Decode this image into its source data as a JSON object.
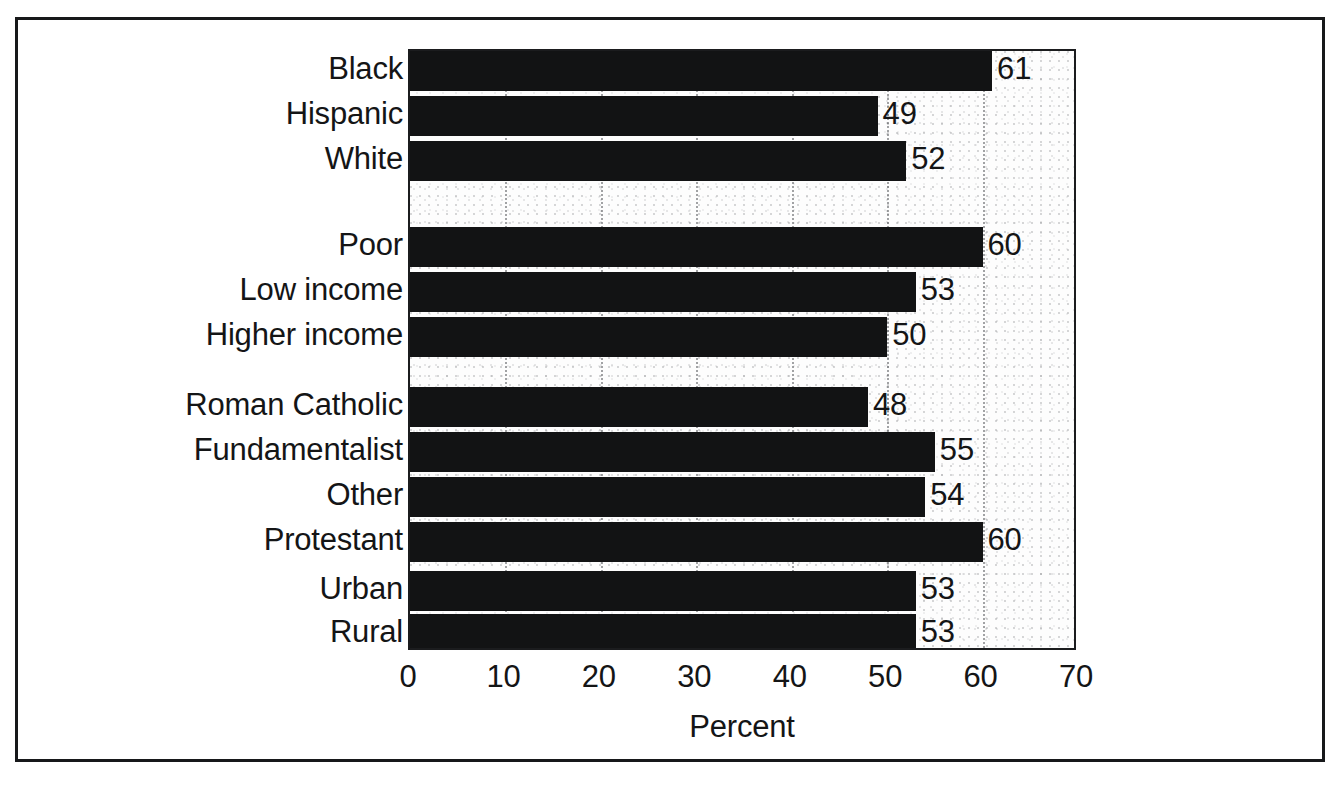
{
  "chart_data": {
    "type": "bar",
    "orientation": "horizontal",
    "title": "",
    "xlabel": "Percent",
    "ylabel": "",
    "xlim": [
      0,
      70
    ],
    "xticks": [
      0,
      10,
      20,
      30,
      40,
      50,
      60,
      70
    ],
    "xticklabels": [
      "0",
      "10",
      "20",
      "30",
      "40",
      "50",
      "60",
      "70"
    ],
    "grid": "vertical-dotted",
    "legend": "none",
    "bar_color": "#121314",
    "plot_background": "#fdfdfd",
    "groups": [
      {
        "name": "Race/ethnicity",
        "categories": [
          "Black",
          "Hispanic",
          "White"
        ],
        "values": [
          61,
          49,
          52
        ]
      },
      {
        "name": "Income",
        "categories": [
          "Poor",
          "Low income",
          "Higher income"
        ],
        "values": [
          60,
          53,
          50
        ]
      },
      {
        "name": "Religion",
        "categories": [
          "Roman Catholic",
          "Fundamentalist",
          "Other",
          "Protestant"
        ],
        "values": [
          48,
          55,
          54,
          60
        ]
      },
      {
        "name": "Residence",
        "categories": [
          "Urban",
          "Rural"
        ],
        "values": [
          53,
          53
        ]
      }
    ],
    "categories": [
      "Black",
      "Hispanic",
      "White",
      "Poor",
      "Low income",
      "Higher income",
      "Roman Catholic",
      "Fundamentalist",
      "Other",
      "Protestant",
      "Urban",
      "Rural"
    ],
    "values": [
      61,
      49,
      52,
      60,
      53,
      50,
      48,
      55,
      54,
      60,
      53,
      53
    ],
    "value_labels": [
      "61",
      "49",
      "52",
      "60",
      "53",
      "50",
      "48",
      "55",
      "54",
      "60",
      "53",
      "53"
    ]
  },
  "bars": [
    {
      "label": "Black",
      "value": 61,
      "value_label": "61",
      "top": 0
    },
    {
      "label": "Hispanic",
      "value": 49,
      "value_label": "49",
      "top": 45
    },
    {
      "label": "White",
      "value": 52,
      "value_label": "52",
      "top": 90
    },
    {
      "label": "Poor",
      "value": 60,
      "value_label": "60",
      "top": 176
    },
    {
      "label": "Low income",
      "value": 53,
      "value_label": "53",
      "top": 221
    },
    {
      "label": "Higher income",
      "value": 50,
      "value_label": "50",
      "top": 266
    },
    {
      "label": "Roman Catholic",
      "value": 48,
      "value_label": "48",
      "top": 336
    },
    {
      "label": "Fundamentalist",
      "value": 55,
      "value_label": "55",
      "top": 381
    },
    {
      "label": "Other",
      "value": 54,
      "value_label": "54",
      "top": 426
    },
    {
      "label": "Protestant",
      "value": 60,
      "value_label": "60",
      "top": 471
    },
    {
      "label": "Urban",
      "value": 53,
      "value_label": "53",
      "top": 520
    },
    {
      "label": "Rural",
      "value": 53,
      "value_label": "53",
      "top": 563
    }
  ],
  "axis": {
    "xlabel": "Percent",
    "ticks": [
      {
        "label": "0",
        "value": 0
      },
      {
        "label": "10",
        "value": 10
      },
      {
        "label": "20",
        "value": 20
      },
      {
        "label": "30",
        "value": 30
      },
      {
        "label": "40",
        "value": 40
      },
      {
        "label": "50",
        "value": 50
      },
      {
        "label": "60",
        "value": 60
      },
      {
        "label": "70",
        "value": 70
      }
    ]
  },
  "colors": {
    "bar": "#121314",
    "frame": "#17181a",
    "text": "#141516",
    "plot_bg": "#fdfdfd"
  }
}
